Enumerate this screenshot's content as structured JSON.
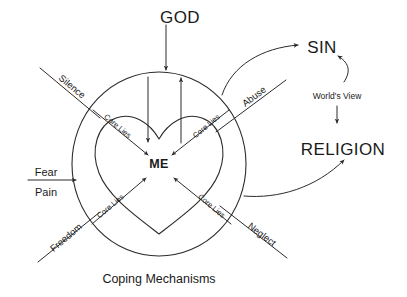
{
  "diagram": {
    "title_top": "GOD",
    "center_label": "ME",
    "caption": "Coping Mechanisms",
    "right_column": {
      "top_label": "SIN",
      "middle_label": "World's View",
      "bottom_label": "RELIGION"
    },
    "inputs": [
      {
        "name": "silence",
        "label": "Silence",
        "position": "upper-left"
      },
      {
        "name": "fear",
        "label": "Fear",
        "position": "left-upper-of-arrow"
      },
      {
        "name": "pain",
        "label": "Pain",
        "position": "left-lower-of-arrow"
      },
      {
        "name": "freedom",
        "label": "Freedom",
        "position": "lower-left"
      },
      {
        "name": "abuse",
        "label": "Abuse",
        "position": "upper-right"
      },
      {
        "name": "neglect",
        "label": "Neglect",
        "position": "lower-right"
      }
    ],
    "core_lies": [
      {
        "name": "core-lies-top-left",
        "label": "Core Lies"
      },
      {
        "name": "core-lies-top-right",
        "label": "Core Lies"
      },
      {
        "name": "core-lies-bottom-left",
        "label": "Core Lies"
      },
      {
        "name": "core-lies-bottom-right",
        "label": "Core Lies"
      }
    ],
    "colors": {
      "ink": "#2b2b2b",
      "text": "#1a1a1a",
      "background": "#ffffff"
    }
  }
}
